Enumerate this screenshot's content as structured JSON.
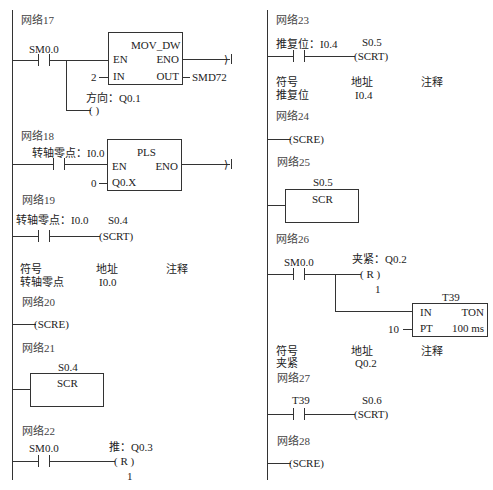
{
  "left_column": {
    "network17": {
      "title": "网络17",
      "contact": "SM0.0",
      "block": {
        "name": "MOV_DW",
        "en": "EN",
        "eno": "ENO",
        "in": "IN",
        "out": "OUT",
        "in_value": "2",
        "out_value": "SMD72"
      },
      "coil_label": "方向：Q0.1",
      "coil": "(      )"
    },
    "network18": {
      "title": "网络18",
      "contact": "转轴零点：I0.0",
      "block": {
        "name": "PLS",
        "en": "EN",
        "eno": "ENO",
        "q": "Q0.X",
        "q_value": "0"
      }
    },
    "network19": {
      "title": "网络19",
      "contact": "转轴零点：I0.0",
      "coil_addr": "S0.4",
      "coil": "(SCRT)",
      "symbol_table": {
        "headers": [
          "符号",
          "地址",
          "注释"
        ],
        "rows": [
          [
            "转轴零点",
            "I0.0",
            ""
          ]
        ]
      }
    },
    "network20": {
      "title": "网络20",
      "coil": "(SCRE)"
    },
    "network21": {
      "title": "网络21",
      "block_addr": "S0.4",
      "block_name": "SCR"
    },
    "network22": {
      "title": "网络22",
      "contact": "SM0.0",
      "coil_label": "推：Q0.3",
      "coil": "(  R  )",
      "coil_count": "1"
    }
  },
  "right_column": {
    "network23": {
      "title": "网络23",
      "contact": "推复位：I0.4",
      "coil_addr": "S0.5",
      "coil": "(SCRT)",
      "symbol_table": {
        "headers": [
          "符号",
          "地址",
          "注释"
        ],
        "rows": [
          [
            "推复位",
            "I0.4",
            ""
          ]
        ]
      }
    },
    "network24": {
      "title": "网络24",
      "coil": "(SCRE)"
    },
    "network25": {
      "title": "网络25",
      "block_addr": "S0.5",
      "block_name": "SCR"
    },
    "network26": {
      "title": "网络26",
      "contact": "SM0.0",
      "coil_label": "夹紧：Q0.2",
      "coil": "(  R  )",
      "coil_count": "1",
      "timer": {
        "name": "T39",
        "in": "IN",
        "type": "TON",
        "pt": "PT",
        "pt_value": "10",
        "base": "100 ms"
      },
      "symbol_table": {
        "headers": [
          "符号",
          "地址",
          "注释"
        ],
        "rows": [
          [
            "夹紧",
            "Q0.2",
            ""
          ]
        ]
      }
    },
    "network27": {
      "title": "网络27",
      "contact": "T39",
      "coil_addr": "S0.6",
      "coil": "(SCRT)"
    },
    "network28": {
      "title": "网络28",
      "coil": "(SCRE)"
    }
  }
}
